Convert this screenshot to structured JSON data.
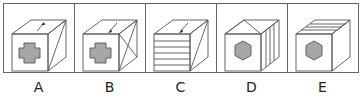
{
  "figure": {
    "type": "cube-options",
    "stroke_color": "#555555",
    "fill_color": "#a6a6a6",
    "options": [
      {
        "label": "A",
        "front": "cross",
        "top": "arrow-up-right",
        "right": "diagonal-single"
      },
      {
        "label": "B",
        "front": "cross",
        "top": "arrow-down-left",
        "right": "diagonal-cross"
      },
      {
        "label": "C",
        "front": "horizontal-stripes",
        "top": "arrow-down-left",
        "right": "diagonal-single"
      },
      {
        "label": "D",
        "front": "hexagon",
        "top": "triangle-roof",
        "right": "vertical-stripes"
      },
      {
        "label": "E",
        "front": "hexagon",
        "top": "diagonal-stripes",
        "right": "empty"
      }
    ]
  }
}
